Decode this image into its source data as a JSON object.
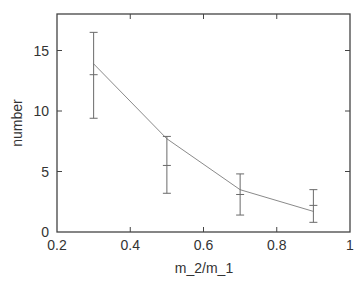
{
  "chart_data": {
    "type": "line",
    "title": "",
    "xlabel": "m_2/m_1",
    "ylabel": "number",
    "xlim": [
      0.2,
      1.0
    ],
    "ylim": [
      0,
      18
    ],
    "grid": false,
    "legend": null,
    "x_ticks": [
      0.2,
      0.4,
      0.6,
      0.8,
      1.0
    ],
    "x_tick_labels": [
      "0.2",
      "0.4",
      "0.6",
      "0.8",
      "1"
    ],
    "y_ticks": [
      0,
      5,
      10,
      15
    ],
    "y_tick_labels": [
      "0",
      "5",
      "10",
      "15"
    ],
    "series": [
      {
        "name": "line",
        "x": [
          0.3,
          0.5,
          0.7,
          0.9
        ],
        "values": [
          13.9,
          7.7,
          3.5,
          1.7
        ],
        "color": "#8a8a8a"
      },
      {
        "name": "error bars",
        "x": [
          0.3,
          0.5,
          0.7,
          0.9
        ],
        "values": [
          13.0,
          5.5,
          3.1,
          2.2
        ],
        "err_low": [
          9.4,
          3.2,
          1.4,
          0.8
        ],
        "err_high": [
          16.5,
          7.9,
          4.8,
          3.5
        ],
        "color": "#6a6a6a"
      }
    ]
  },
  "colors": {
    "axis": "#444444",
    "text": "#333333",
    "background": "#ffffff"
  }
}
